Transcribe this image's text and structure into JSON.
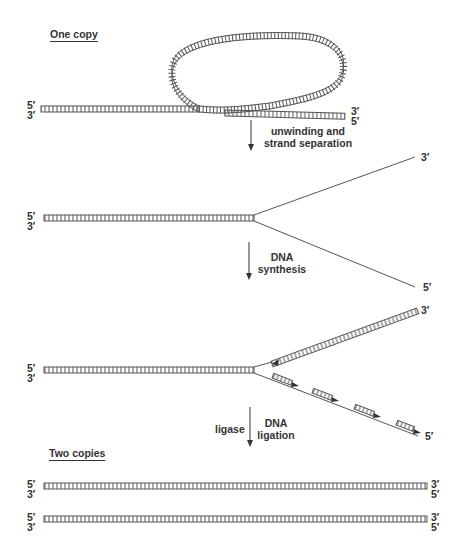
{
  "diagram": {
    "headings": {
      "top": "One copy",
      "bottom": "Two copies"
    },
    "steps": [
      {
        "line1": "unwinding and",
        "line2": "strand separation"
      },
      {
        "line1": "DNA",
        "line2": "synthesis"
      },
      {
        "enzyme": "ligase",
        "line1": "DNA",
        "line2": "ligation"
      }
    ],
    "end_labels": {
      "five_prime": "5′",
      "three_prime": "3′"
    },
    "colors": {
      "strand": "#555555",
      "text": "#333333",
      "background": "#ffffff"
    }
  }
}
